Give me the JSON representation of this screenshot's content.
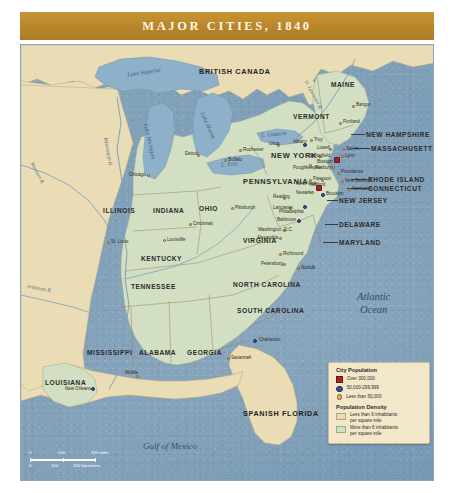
{
  "banner": {
    "title": "MAJOR CITIES, 1840"
  },
  "ocean_labels": {
    "atlantic_line1": "Atlantic",
    "atlantic_line2": "Ocean",
    "gulf": "Gulf of Mexico"
  },
  "countries": [
    {
      "name": "BRITISH CANADA"
    },
    {
      "name": "SPANISH FLORIDA"
    }
  ],
  "lakes": [
    {
      "name": "Lake Superior"
    },
    {
      "name": "Lake Michigan"
    },
    {
      "name": "Lake Huron"
    },
    {
      "name": "L. Erie"
    },
    {
      "name": "L. Ontario"
    }
  ],
  "rivers": [
    {
      "name": "Mississippi R."
    },
    {
      "name": "Missouri R."
    },
    {
      "name": "Arkansas R."
    },
    {
      "name": "St. Lawrence R."
    }
  ],
  "states": [
    {
      "name": "MAINE"
    },
    {
      "name": "VERMONT"
    },
    {
      "name": "NEW HAMPSHIRE"
    },
    {
      "name": "MASSACHUSETTS"
    },
    {
      "name": "RHODE ISLAND"
    },
    {
      "name": "CONNECTICUT"
    },
    {
      "name": "NEW YORK"
    },
    {
      "name": "NEW JERSEY"
    },
    {
      "name": "PENNSYLVANIA"
    },
    {
      "name": "DELAWARE"
    },
    {
      "name": "MARYLAND"
    },
    {
      "name": "VIRGINIA"
    },
    {
      "name": "NORTH CAROLINA"
    },
    {
      "name": "SOUTH CAROLINA"
    },
    {
      "name": "GEORGIA"
    },
    {
      "name": "ALABAMA"
    },
    {
      "name": "MISSISSIPPI"
    },
    {
      "name": "LOUISIANA"
    },
    {
      "name": "TENNESSEE"
    },
    {
      "name": "KENTUCKY"
    },
    {
      "name": "OHIO"
    },
    {
      "name": "INDIANA"
    },
    {
      "name": "ILLINOIS"
    }
  ],
  "cities": [
    {
      "name": "Bangor",
      "size": "small"
    },
    {
      "name": "Portland",
      "size": "small"
    },
    {
      "name": "Lowell",
      "size": "small"
    },
    {
      "name": "Boston",
      "size": "large"
    },
    {
      "name": "Roxbury",
      "size": "small"
    },
    {
      "name": "Lynn",
      "size": "small"
    },
    {
      "name": "Salem",
      "size": "small"
    },
    {
      "name": "Providence",
      "size": "small"
    },
    {
      "name": "New Bedford",
      "size": "small"
    },
    {
      "name": "Nantucket",
      "size": "small"
    },
    {
      "name": "Hartford",
      "size": "small"
    },
    {
      "name": "Springfield",
      "size": "small"
    },
    {
      "name": "Albany",
      "size": "medium"
    },
    {
      "name": "Troy",
      "size": "small"
    },
    {
      "name": "Utica",
      "size": "small"
    },
    {
      "name": "Rochester",
      "size": "small"
    },
    {
      "name": "Buffalo",
      "size": "small"
    },
    {
      "name": "Poughkeepsie",
      "size": "small"
    },
    {
      "name": "New York",
      "size": "large"
    },
    {
      "name": "Brooklyn",
      "size": "medium"
    },
    {
      "name": "Newark",
      "size": "small"
    },
    {
      "name": "Paterson",
      "size": "small"
    },
    {
      "name": "Philadelphia",
      "size": "medium"
    },
    {
      "name": "Reading",
      "size": "small"
    },
    {
      "name": "Lancaster",
      "size": "small"
    },
    {
      "name": "Pittsburgh",
      "size": "small"
    },
    {
      "name": "Baltimore",
      "size": "medium"
    },
    {
      "name": "Washington, D.C.",
      "size": "small"
    },
    {
      "name": "Alexandria",
      "size": "small"
    },
    {
      "name": "Richmond",
      "size": "small"
    },
    {
      "name": "Petersburg",
      "size": "small"
    },
    {
      "name": "Norfolk",
      "size": "small"
    },
    {
      "name": "Charleston",
      "size": "medium"
    },
    {
      "name": "Savannah",
      "size": "small"
    },
    {
      "name": "Mobile",
      "size": "small"
    },
    {
      "name": "New Orleans",
      "size": "medium"
    },
    {
      "name": "Louisville",
      "size": "small"
    },
    {
      "name": "Cincinnati",
      "size": "small"
    },
    {
      "name": "St. Louis",
      "size": "small"
    },
    {
      "name": "Chicago",
      "size": "small"
    },
    {
      "name": "Detroit",
      "size": "small"
    }
  ],
  "legend": {
    "population_title": "City Population",
    "population_items": [
      {
        "label": "Over 300,000",
        "symbol": "red-square"
      },
      {
        "label": "50,000-299,999",
        "symbol": "blue-circle"
      },
      {
        "label": "Less than 50,000",
        "symbol": "orange-circle"
      }
    ],
    "density_title": "Population Density",
    "density_items": [
      {
        "line1": "Less than 6 inhabitants",
        "line2": "per square mile",
        "symbol": "tan-swatch"
      },
      {
        "line1": "More than 6 inhabitants",
        "line2": "per square mile",
        "symbol": "green-swatch"
      }
    ]
  },
  "scale": {
    "miles": {
      "zero": "0",
      "mid": "100",
      "end": "200 miles"
    },
    "kilometers": {
      "zero": "0",
      "mid": "100",
      "end": "200 kilometers"
    }
  },
  "colors": {
    "banner": "#b8862a",
    "ocean": "#7d9db7",
    "low_density": "#eadcb4",
    "high_density": "#d2dfc2",
    "over_300k": "#a8231f",
    "mid_city": "#3a4f8c",
    "small_city": "#e0b45a"
  }
}
